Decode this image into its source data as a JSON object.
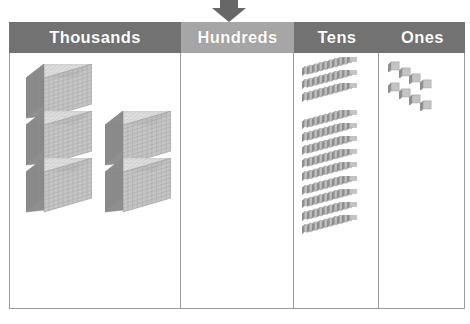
{
  "diagram": {
    "type": "place-value-chart",
    "arrow": {
      "name": "down-arrow-marker",
      "points_to": "Hundreds",
      "color": "#676767"
    },
    "colors": {
      "header_dark": "#727272",
      "header_light": "#a6a6a6",
      "header_text": "#ffffff",
      "border": "#9a9a9a",
      "block_light": "#e8e8e8",
      "block_mid": "#c4c4c4",
      "block_dark": "#8f8f8f",
      "background": "#ffffff"
    },
    "columns": [
      {
        "id": "thousands",
        "label": "Thousands",
        "header_style": "dark",
        "block_type": "thousand-cube",
        "block_value": 1000,
        "count": 5,
        "place_digit": 5,
        "groups": [
          {
            "name": "left-stack",
            "count": 3
          },
          {
            "name": "right-stack",
            "count": 2
          }
        ]
      },
      {
        "id": "hundreds",
        "label": "Hundreds",
        "header_style": "light",
        "block_type": "hundred-flat",
        "block_value": 100,
        "count": 0,
        "place_digit": 0,
        "groups": []
      },
      {
        "id": "tens",
        "label": "Tens",
        "header_style": "dark",
        "block_type": "ten-rod",
        "block_value": 10,
        "count": 12,
        "place_digit": 12,
        "groups": [
          {
            "name": "top-group",
            "count": 3
          },
          {
            "name": "bottom-group",
            "count": 9
          }
        ]
      },
      {
        "id": "ones",
        "label": "Ones",
        "header_style": "dark",
        "block_type": "one-unit",
        "block_value": 1,
        "count": 8,
        "place_digit": 8,
        "groups": [
          {
            "name": "top-row",
            "count": 4
          },
          {
            "name": "bottom-row",
            "count": 4
          }
        ]
      }
    ]
  },
  "chart_data": {
    "type": "bar",
    "categories": [
      "Thousands",
      "Hundreds",
      "Tens",
      "Ones"
    ],
    "values": [
      5,
      0,
      12,
      8
    ],
    "xlabel": "Place Value",
    "ylabel": "Number of Blocks",
    "annotations": [
      "Arrow points to the Hundreds column"
    ],
    "grid": false,
    "legend": "none"
  }
}
